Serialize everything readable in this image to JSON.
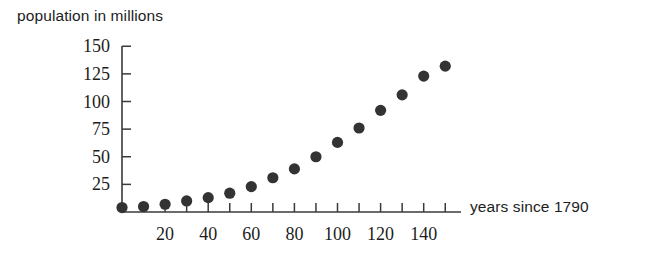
{
  "chart_data": {
    "type": "scatter",
    "title": "",
    "ylabel": "population in millions",
    "xlabel": "years since 1790",
    "xlim": [
      0,
      155
    ],
    "ylim": [
      0,
      158
    ],
    "grid": false,
    "legend": false,
    "marker_color": "#333333",
    "axis_color": "#3a3a3a",
    "x_tick_labels": [
      "20",
      "40",
      "60",
      "80",
      "100",
      "120",
      "140"
    ],
    "x_tick_values": [
      20,
      40,
      60,
      80,
      100,
      120,
      140
    ],
    "x_minor_tick_values": [
      10,
      20,
      30,
      40,
      50,
      60,
      70,
      80,
      90,
      100,
      110,
      120,
      130,
      140,
      150
    ],
    "y_tick_labels": [
      "25",
      "50",
      "75",
      "100",
      "125",
      "150"
    ],
    "y_tick_values": [
      25,
      50,
      75,
      100,
      125,
      150
    ],
    "x": [
      0,
      10,
      20,
      30,
      40,
      50,
      60,
      70,
      80,
      90,
      100,
      110,
      120,
      130,
      140,
      150
    ],
    "values": [
      4,
      5,
      7,
      10,
      13,
      17,
      23,
      31,
      39,
      50,
      63,
      76,
      92,
      106,
      123,
      132
    ],
    "points": [
      {
        "x": 0,
        "y": 4
      },
      {
        "x": 10,
        "y": 5
      },
      {
        "x": 20,
        "y": 7
      },
      {
        "x": 30,
        "y": 10
      },
      {
        "x": 40,
        "y": 13
      },
      {
        "x": 50,
        "y": 17
      },
      {
        "x": 60,
        "y": 23
      },
      {
        "x": 70,
        "y": 31
      },
      {
        "x": 80,
        "y": 39
      },
      {
        "x": 90,
        "y": 50
      },
      {
        "x": 100,
        "y": 63
      },
      {
        "x": 110,
        "y": 76
      },
      {
        "x": 120,
        "y": 92
      },
      {
        "x": 130,
        "y": 106
      },
      {
        "x": 140,
        "y": 123
      },
      {
        "x": 150,
        "y": 132
      }
    ]
  }
}
